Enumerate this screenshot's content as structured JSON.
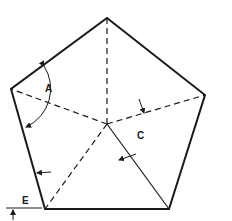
{
  "diagram": {
    "type": "regular-pentagon-angle-diagram",
    "colors": {
      "stroke": "#1a1a1a",
      "background": "#ffffff"
    },
    "vertices": {
      "top": [
        107,
        18
      ],
      "right": [
        205,
        95
      ],
      "bottom_right": [
        169,
        209
      ],
      "bottom_left": [
        45,
        209
      ],
      "left": [
        11,
        89
      ]
    },
    "center": [
      107,
      124
    ],
    "labels": {
      "A": "A",
      "C": "C",
      "E": "E"
    }
  }
}
